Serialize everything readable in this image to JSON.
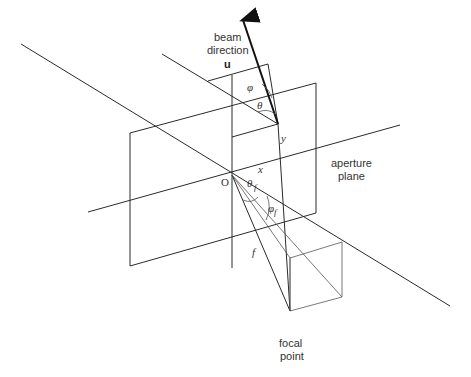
{
  "diagram": {
    "labels": {
      "beam_line1": "beam",
      "beam_line2": "direction",
      "beam_vector": "u",
      "aperture_line1": "aperture",
      "aperture_line2": "plane",
      "focal_line1": "focal",
      "focal_line2": "point",
      "origin": "O",
      "x_axis": "x",
      "y_axis": "y",
      "focal_length": "f",
      "phi": "φ",
      "theta": "θ",
      "theta_f": "θ",
      "theta_f_sub": "f",
      "phi_f": "φ",
      "phi_f_sub": "f"
    },
    "colors": {
      "line": "#2a2a2a",
      "text": "#333333",
      "background": "#ffffff"
    }
  }
}
